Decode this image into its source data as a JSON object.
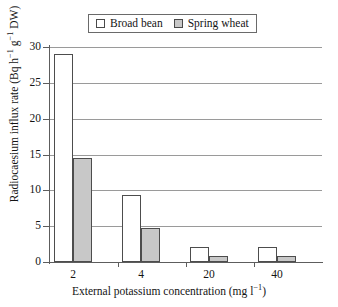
{
  "chart_data": {
    "type": "bar",
    "title": "",
    "subtitle": "",
    "xlabel": "External potassium concentration (mg l⁻¹)",
    "ylabel": "Radiocaesium influx rate (Bq h⁻¹ g⁻¹ DW)",
    "categories": [
      "2",
      "4",
      "20",
      "40"
    ],
    "series": [
      {
        "name": "Broad bean",
        "color": "#ffffff",
        "values": [
          29.0,
          9.3,
          2.1,
          2.1
        ]
      },
      {
        "name": "Spring wheat",
        "color": "#c8c8c8",
        "values": [
          14.5,
          4.7,
          0.8,
          0.8
        ]
      }
    ],
    "ylim": [
      0,
      30
    ],
    "ytick_labels": [
      "0",
      "5",
      "10",
      "15",
      "20",
      "25",
      "30"
    ],
    "ytick_values": [
      0,
      5,
      10,
      15,
      20,
      25,
      30
    ],
    "xtick_labels": [
      "2",
      "4",
      "20",
      "40"
    ],
    "grid": "horizontal",
    "legend_position": "top-center",
    "legend_entries": [
      "Broad bean",
      "Spring wheat"
    ]
  },
  "legend": {
    "entries": [
      {
        "label": "Broad bean",
        "swatch": "white-square-icon"
      },
      {
        "label": "Spring wheat",
        "swatch": "gray-square-icon"
      }
    ]
  },
  "axes": {
    "y": {
      "title": "Radiocaesium influx rate (Bq h⁻¹ g⁻¹ DW)",
      "ticks": [
        "0",
        "5",
        "10",
        "15",
        "20",
        "25",
        "30"
      ]
    },
    "x": {
      "title": "External potassium concentration (mg l⁻¹)",
      "ticks": [
        "2",
        "4",
        "20",
        "40"
      ]
    }
  },
  "colors": {
    "broad_bean_fill": "#ffffff",
    "spring_wheat_fill": "#c8c8c8",
    "bar_outline": "#4d4d4d",
    "gridline": "#9a9a9a",
    "axis": "#5d5d5d",
    "text": "#141414",
    "background": "#ffffff"
  }
}
